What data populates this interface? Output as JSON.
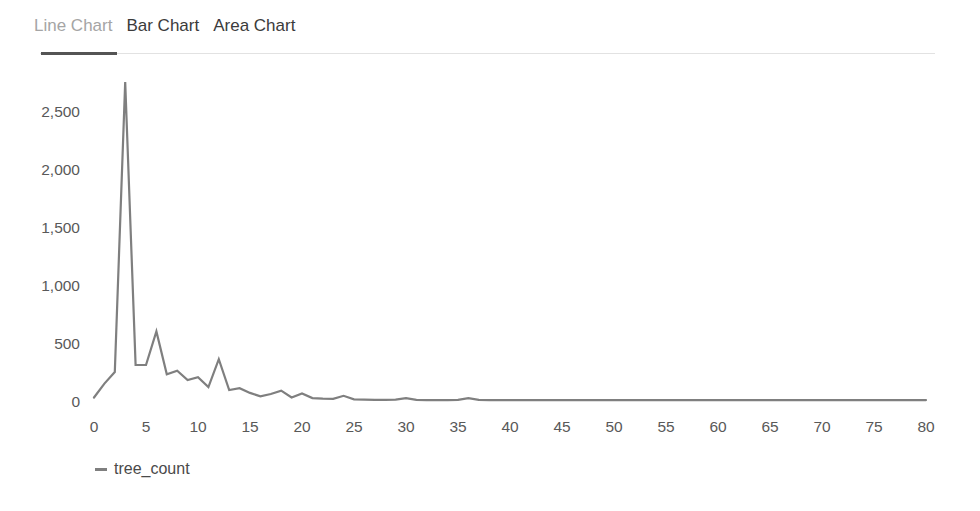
{
  "tabs": {
    "items": [
      {
        "label": "Line Chart",
        "active": true
      },
      {
        "label": "Bar Chart",
        "active": false
      },
      {
        "label": "Area Chart",
        "active": false
      }
    ]
  },
  "legend": {
    "label": "tree_count"
  },
  "colors": {
    "background": "#ffffff",
    "line": "#7f7f7f",
    "tick_label": "#595959",
    "tab_active_text": "#a5a5a5",
    "tab_inactive_text": "#3b3b3b",
    "tab_active_underline": "#545454",
    "tab_rule": "#e2e2e2",
    "legend_marker": "#7f7f7f",
    "legend_text": "#4a4a4a"
  },
  "chart_data": {
    "type": "line",
    "title": "",
    "xlabel": "",
    "ylabel": "",
    "grid": false,
    "legend_position": "bottom-left",
    "xlim": [
      0,
      80
    ],
    "ylim": [
      0,
      2750
    ],
    "x_ticks": [
      0,
      5,
      10,
      15,
      20,
      25,
      30,
      35,
      40,
      45,
      50,
      55,
      60,
      65,
      70,
      75,
      80
    ],
    "y_ticks": [
      0,
      500,
      1000,
      1500,
      2000,
      2500
    ],
    "series": [
      {
        "name": "tree_count",
        "x": [
          0,
          1,
          2,
          3,
          4,
          5,
          6,
          7,
          8,
          9,
          10,
          11,
          12,
          13,
          14,
          15,
          16,
          17,
          18,
          19,
          20,
          21,
          22,
          23,
          24,
          25,
          26,
          27,
          28,
          29,
          30,
          31,
          32,
          33,
          34,
          35,
          36,
          37,
          38,
          39,
          40,
          41,
          42,
          43,
          44,
          45,
          46,
          47,
          48,
          49,
          50,
          51,
          52,
          53,
          54,
          55,
          56,
          57,
          58,
          59,
          60,
          61,
          62,
          63,
          64,
          65,
          66,
          67,
          68,
          69,
          70,
          71,
          72,
          73,
          74,
          75,
          76,
          77,
          78,
          79,
          80
        ],
        "values": [
          30,
          150,
          250,
          2750,
          310,
          310,
          600,
          230,
          260,
          180,
          205,
          120,
          360,
          95,
          110,
          70,
          40,
          60,
          90,
          30,
          65,
          25,
          20,
          18,
          45,
          15,
          12,
          10,
          10,
          12,
          25,
          10,
          8,
          8,
          8,
          10,
          25,
          10,
          8,
          8,
          8,
          8,
          8,
          8,
          8,
          8,
          8,
          8,
          8,
          8,
          8,
          8,
          8,
          8,
          8,
          8,
          8,
          8,
          8,
          8,
          8,
          8,
          8,
          8,
          8,
          8,
          8,
          8,
          8,
          8,
          8,
          8,
          8,
          8,
          8,
          8,
          8,
          8,
          8,
          8,
          8
        ]
      }
    ]
  }
}
